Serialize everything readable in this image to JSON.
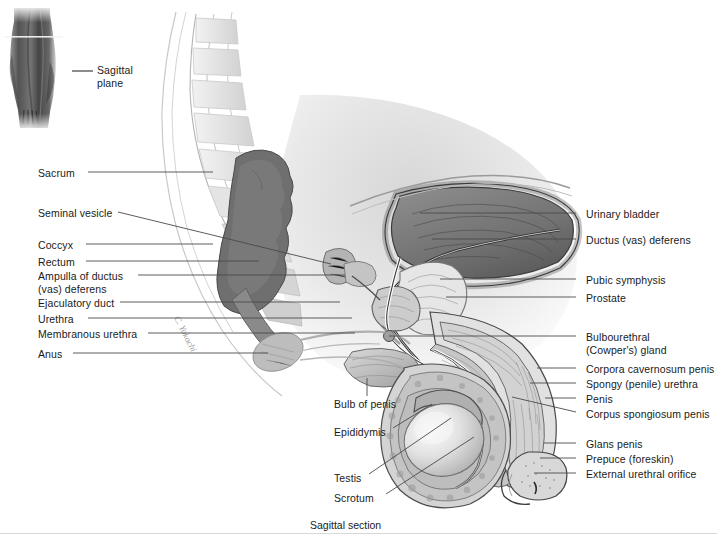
{
  "figure": {
    "caption": "Sagittal section",
    "inset": {
      "label_line1": "Sagittal",
      "label_line2": "plane",
      "description": "orientation-figure-male-torso"
    },
    "artist_signature": "C. Yokochi"
  },
  "labels_left": [
    {
      "id": "sacrum",
      "text": "Sacrum",
      "x": 38,
      "y": 167,
      "line": [
        88,
        172,
        213,
        172
      ]
    },
    {
      "id": "seminal-vesicle",
      "text": "Seminal vesicle",
      "x": 38,
      "y": 207,
      "line": [
        118,
        212,
        331,
        264
      ]
    },
    {
      "id": "coccyx",
      "text": "Coccyx",
      "x": 38,
      "y": 239,
      "line": [
        86,
        244,
        213,
        244
      ]
    },
    {
      "id": "rectum",
      "text": "Rectum",
      "x": 38,
      "y": 256,
      "line": [
        86,
        261,
        259,
        261
      ]
    },
    {
      "id": "ampulla-of-ductus-deferens",
      "text": "Ampulla of ductus\n(vas) deferens",
      "x": 38,
      "y": 270,
      "line": [
        138,
        275,
        345,
        275
      ]
    },
    {
      "id": "ejaculatory-duct",
      "text": "Ejaculatory duct",
      "x": 38,
      "y": 297,
      "line": [
        120,
        302,
        340,
        302
      ]
    },
    {
      "id": "urethra",
      "text": "Urethra",
      "x": 38,
      "y": 313,
      "line": [
        88,
        318,
        352,
        318
      ]
    },
    {
      "id": "membranous-urethra",
      "text": "Membranous urethra",
      "x": 38,
      "y": 328,
      "line": [
        148,
        333,
        355,
        333
      ]
    },
    {
      "id": "anus",
      "text": "Anus",
      "x": 38,
      "y": 348,
      "line": [
        73,
        353,
        268,
        353
      ]
    }
  ],
  "labels_right": [
    {
      "id": "urinary-bladder",
      "text": "Urinary bladder",
      "x": 586,
      "y": 208,
      "line": [
        576,
        213,
        420,
        213
      ]
    },
    {
      "id": "ductus-vas-deferens",
      "text": "Ductus (vas) deferens",
      "x": 586,
      "y": 234,
      "line": [
        576,
        239,
        432,
        239
      ]
    },
    {
      "id": "pubic-symphysis",
      "text": "Pubic symphysis",
      "x": 586,
      "y": 274,
      "line": [
        576,
        279,
        440,
        279
      ]
    },
    {
      "id": "prostate",
      "text": "Prostate",
      "x": 586,
      "y": 292,
      "line": [
        576,
        297,
        446,
        297
      ]
    },
    {
      "id": "bulbourethral-cowpers-gland",
      "text": "Bulbourethral\n(Cowper's) gland",
      "x": 586,
      "y": 331,
      "line": [
        576,
        336,
        389,
        336
      ]
    },
    {
      "id": "corpora-cavernosum-penis",
      "text": "Corpora cavernosum penis",
      "x": 586,
      "y": 363,
      "line": [
        576,
        368,
        537,
        368
      ]
    },
    {
      "id": "spongy-penile-urethra",
      "text": "Spongy (penile) urethra",
      "x": 586,
      "y": 378,
      "line": [
        576,
        383,
        530,
        383
      ]
    },
    {
      "id": "penis",
      "text": "Penis",
      "x": 586,
      "y": 393,
      "line": [
        576,
        398,
        545,
        398
      ]
    },
    {
      "id": "corpus-spongiosum-penis",
      "text": "Corpus spongiosum penis",
      "x": 586,
      "y": 408,
      "line": [
        576,
        412,
        512,
        397
      ]
    },
    {
      "id": "glans-penis",
      "text": "Glans penis",
      "x": 586,
      "y": 438,
      "line": [
        576,
        443,
        544,
        443
      ]
    },
    {
      "id": "prepuce-foreskin",
      "text": "Prepuce (foreskin)",
      "x": 586,
      "y": 453,
      "line": [
        576,
        458,
        540,
        458
      ]
    },
    {
      "id": "external-urethral-orifice",
      "text": "External urethral orifice",
      "x": 586,
      "y": 468,
      "line": [
        576,
        473,
        534,
        473
      ]
    }
  ],
  "labels_center": [
    {
      "id": "bulb-of-penis",
      "text": "Bulb of penis",
      "x": 334,
      "y": 398,
      "line": [
        367,
        396,
        367,
        378
      ]
    },
    {
      "id": "epididymis",
      "text": "Epididymis",
      "x": 334,
      "y": 426,
      "line": [
        393,
        428,
        432,
        404
      ]
    },
    {
      "id": "testis",
      "text": "Testis",
      "x": 334,
      "y": 472,
      "line": [
        369,
        474,
        451,
        418
      ]
    },
    {
      "id": "scrotum",
      "text": "Scrotum",
      "x": 334,
      "y": 492,
      "line": [
        386,
        494,
        474,
        437
      ]
    }
  ],
  "colors": {
    "background": "#ffffff",
    "text": "#1a1a1a",
    "leader_line": "#4a4a4a",
    "footer_rule": "#d8d8d8",
    "tissue_light": "#e9e9e9",
    "tissue_mid": "#b9b9b9",
    "tissue_dark": "#7c7c7c",
    "cavity_dark": "#6f6f6f"
  },
  "caption_position": {
    "x": 310,
    "y": 519
  },
  "footer_rule_y": 533
}
